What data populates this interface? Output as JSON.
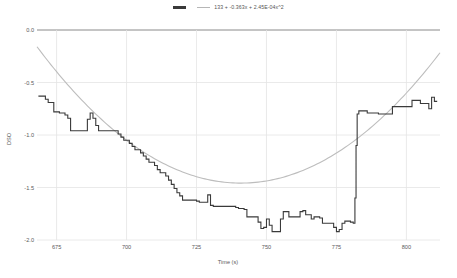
{
  "chart_data": {
    "type": "line",
    "title": "",
    "xlabel": "Time (s)",
    "ylabel": "DSO",
    "xlim": [
      668,
      812
    ],
    "ylim": [
      -2.0,
      0.0
    ],
    "xticks": [
      675,
      700,
      725,
      750,
      775,
      800
    ],
    "yticks": [
      "0.0",
      "-0.5",
      "-1.0",
      "-1.5",
      "-2.0"
    ],
    "grid": true,
    "legend_position": "top-center",
    "series": [
      {
        "name": "data",
        "label": "",
        "color": "#3a3a3a",
        "style": "step",
        "x": [
          668.5,
          670,
          671,
          672,
          673,
          674,
          675,
          676,
          677,
          678,
          679,
          680,
          681,
          682,
          683,
          684,
          685,
          686,
          687,
          688,
          689,
          690,
          691,
          692,
          693,
          694,
          695,
          696,
          697,
          698,
          699,
          700,
          701,
          702,
          703,
          704,
          705,
          706,
          707,
          708,
          709,
          710,
          711,
          712,
          713,
          714,
          715,
          716,
          717,
          718,
          719,
          720,
          721,
          722,
          723,
          724,
          725,
          726,
          727,
          728,
          729,
          730,
          731,
          732,
          733,
          734,
          735,
          736,
          737,
          738,
          739,
          740,
          741,
          742,
          743,
          744,
          745,
          746,
          747,
          748,
          749,
          750,
          751,
          752,
          753,
          754,
          755,
          756,
          757,
          758,
          759,
          760,
          761,
          762,
          763,
          764,
          765,
          766,
          767,
          768,
          769,
          770,
          771,
          772,
          773,
          774,
          775,
          776,
          777,
          778,
          779,
          780,
          781,
          781.6,
          782,
          782.4,
          783,
          784,
          785,
          786,
          787,
          788,
          789,
          790,
          791,
          792,
          793,
          794,
          795,
          796,
          797,
          798,
          799,
          800,
          801,
          802,
          803,
          804,
          805,
          806,
          807,
          808,
          809,
          810,
          811
        ],
        "y": [
          -0.63,
          -0.63,
          -0.66,
          -0.69,
          -0.69,
          -0.78,
          -0.78,
          -0.79,
          -0.79,
          -0.81,
          -0.84,
          -0.96,
          -0.96,
          -0.96,
          -0.96,
          -0.96,
          -0.96,
          -0.85,
          -0.79,
          -0.84,
          -0.91,
          -0.96,
          -0.96,
          -0.96,
          -0.96,
          -0.96,
          -0.96,
          -0.96,
          -0.99,
          -1.02,
          -1.05,
          -1.05,
          -1.08,
          -1.11,
          -1.14,
          -1.14,
          -1.17,
          -1.2,
          -1.23,
          -1.26,
          -1.26,
          -1.29,
          -1.33,
          -1.36,
          -1.36,
          -1.39,
          -1.43,
          -1.47,
          -1.51,
          -1.55,
          -1.58,
          -1.62,
          -1.62,
          -1.62,
          -1.62,
          -1.62,
          -1.63,
          -1.64,
          -1.64,
          -1.64,
          -1.57,
          -1.67,
          -1.68,
          -1.68,
          -1.68,
          -1.68,
          -1.68,
          -1.68,
          -1.68,
          -1.68,
          -1.69,
          -1.7,
          -1.7,
          -1.71,
          -1.78,
          -1.78,
          -1.78,
          -1.78,
          -1.83,
          -1.89,
          -1.88,
          -1.8,
          -1.86,
          -1.92,
          -1.92,
          -1.92,
          -1.8,
          -1.73,
          -1.73,
          -1.78,
          -1.78,
          -1.78,
          -1.78,
          -1.73,
          -1.72,
          -1.76,
          -1.76,
          -1.8,
          -1.78,
          -1.78,
          -1.79,
          -1.84,
          -1.84,
          -1.84,
          -1.84,
          -1.88,
          -1.92,
          -1.9,
          -1.84,
          -1.82,
          -1.82,
          -1.83,
          -1.84,
          -1.6,
          -1.1,
          -0.8,
          -0.77,
          -0.77,
          -0.77,
          -0.79,
          -0.79,
          -0.79,
          -0.79,
          -0.8,
          -0.8,
          -0.8,
          -0.8,
          -0.8,
          -0.73,
          -0.73,
          -0.73,
          -0.73,
          -0.73,
          -0.73,
          -0.73,
          -0.67,
          -0.67,
          -0.67,
          -0.7,
          -0.7,
          -0.7,
          -0.75,
          -0.64,
          -0.68,
          -0.68
        ]
      },
      {
        "name": "fit",
        "label": "133 + -0.363x + 2.45E-04x^2",
        "color": "#b8b8b8",
        "style": "smooth",
        "equation": {
          "intercept": 133,
          "linear": -0.363,
          "quadratic": 0.000245
        }
      }
    ]
  },
  "legend": {
    "items": [
      {
        "marker": "data-swatch",
        "label": ""
      },
      {
        "marker": "fit-swatch",
        "label": "133 + -0.363x + 2.45E-04x^2"
      }
    ]
  }
}
